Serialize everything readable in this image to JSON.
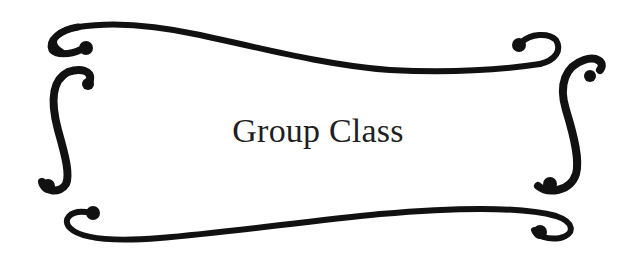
{
  "title": "Group Class",
  "frame": {
    "style": "decorative-scroll-border",
    "stroke_color": "#111111",
    "background": "#ffffff"
  }
}
